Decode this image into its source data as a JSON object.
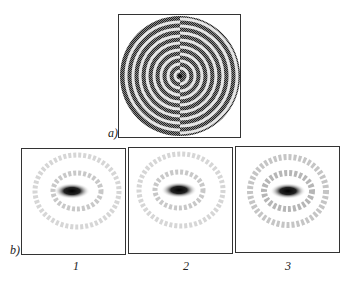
{
  "figure": {
    "panel_a": {
      "label": "a)",
      "description": "Concentric ring phase mask with half-period shift between left and right halves",
      "rings": 9
    },
    "panel_b": {
      "label": "b)",
      "images": [
        {
          "caption": "1",
          "description": "Intensity distribution, dark elongated central spot with faint rings"
        },
        {
          "caption": "2",
          "description": "Intensity distribution, dark elongated central spot with faint rings"
        },
        {
          "caption": "3",
          "description": "Intensity distribution, dark elongated central spot with faint rings"
        }
      ]
    },
    "colors": {
      "ring_dark": "#1a1a1a",
      "ring_light": "#d0d0d0",
      "border": "#333333"
    }
  }
}
